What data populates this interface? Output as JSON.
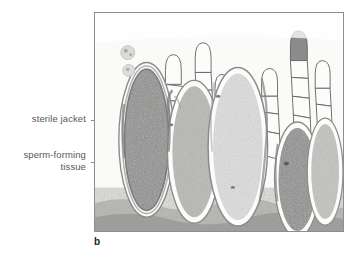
{
  "figure": {
    "panel_letter": "b",
    "kind": "light-micrograph",
    "frame": {
      "x": 94,
      "y": 12,
      "width": 250,
      "height": 220
    },
    "border_color": "#8e8e90",
    "background_color": "#ffffff",
    "plate_tint": "#fbfbfa"
  },
  "labels": {
    "text_color": "#58585a",
    "leader_color": "#8c8c8e",
    "items": [
      {
        "name": "sterile-jacket",
        "text": "sterile jacket",
        "lines": [
          "sterile jacket"
        ],
        "leader": {
          "x1": 91,
          "y1": 120,
          "x2": 153,
          "y2": 120
        }
      },
      {
        "name": "sperm-forming-tissue",
        "text": "sperm-forming\ntissue",
        "lines": [
          "sperm-forming",
          "tissue"
        ],
        "leader": {
          "x1": 91,
          "y1": 162,
          "x2": 173,
          "y2": 162
        }
      }
    ]
  },
  "micrograph": {
    "palette": {
      "stain_dark": "#6f6f70",
      "stain_mid": "#9a9a9b",
      "stain_light": "#c9c9c8",
      "wall_line": "#6a6a6b",
      "paraphysis_line": "#5f5f60",
      "basal_tissue": "#a2a2a1",
      "plate": "#fbfbfa"
    },
    "antheridia": [
      {
        "name": "antheridium-left-dark",
        "cx": 52,
        "cy": 128,
        "rx": 23,
        "ry": 72,
        "fill": "stain_dark",
        "note": "dark sperm-forming tissue, prominent sterile jacket"
      },
      {
        "name": "antheridium-left-mid",
        "cx": 100,
        "cy": 140,
        "rx": 22,
        "ry": 66,
        "fill": "stain_mid",
        "note": "mid-stain, jacket visible at left margin"
      },
      {
        "name": "antheridium-center-light",
        "cx": 144,
        "cy": 135,
        "rx": 25,
        "ry": 74,
        "fill": "stain_light",
        "note": "lightly stained, large"
      },
      {
        "name": "antheridium-right-dark",
        "cx": 204,
        "cy": 168,
        "rx": 19,
        "ry": 52,
        "fill": "stain_dark",
        "note": "dark, lower position"
      },
      {
        "name": "antheridium-far-right",
        "cx": 232,
        "cy": 160,
        "rx": 14,
        "ry": 48,
        "fill": "stain_mid",
        "note": "partly cut by frame edge"
      }
    ],
    "paraphyses": [
      {
        "name": "paraphysis-1",
        "x": 78,
        "top": 42,
        "cells": 5
      },
      {
        "name": "paraphysis-2",
        "x": 108,
        "top": 30,
        "cells": 6
      },
      {
        "name": "paraphysis-3",
        "x": 128,
        "top": 62,
        "cells": 4
      },
      {
        "name": "paraphysis-4",
        "x": 175,
        "top": 56,
        "cells": 4
      },
      {
        "name": "paraphysis-5",
        "x": 205,
        "top": 18,
        "cells": 6
      },
      {
        "name": "paraphysis-6",
        "x": 228,
        "top": 48,
        "cells": 5
      }
    ],
    "free_cells": [
      {
        "name": "free-cell-upper",
        "cx": 33,
        "cy": 40,
        "r": 7
      },
      {
        "name": "free-cell-lower",
        "cx": 34,
        "cy": 58,
        "r": 6
      }
    ],
    "basal_tissue": {
      "name": "basal-tissue-band",
      "top": 176,
      "height": 44
    }
  }
}
